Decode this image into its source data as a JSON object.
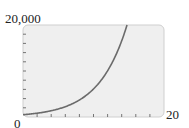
{
  "chart_data": {
    "type": "line",
    "title": "",
    "xlabel": "",
    "ylabel": "",
    "xlim": [
      0,
      20
    ],
    "ylim": [
      0,
      20000
    ],
    "x_tick_labels": [
      "0",
      "20"
    ],
    "y_tick_labels": [
      "0",
      "20,000"
    ],
    "x_tick_step": 2,
    "y_tick_step": 2000,
    "grid": false,
    "legend": null,
    "series": [
      {
        "name": "exponential curve",
        "function": "y = 500 * e^(0.25x)",
        "x": [
          0,
          2,
          4,
          6,
          8,
          10,
          12,
          14,
          14.75
        ],
        "values": [
          500,
          824,
          1359,
          2241,
          3695,
          6091,
          10043,
          16558,
          20000
        ],
        "color": "#6b6b6b"
      }
    ]
  },
  "labels": {
    "y_max": "20,000",
    "origin": "0",
    "x_max": "20"
  },
  "colors": {
    "plot_fill": "#efefef",
    "plot_border": "#cfcfcf",
    "tick": "#555555",
    "curve": "#6b6b6b"
  }
}
